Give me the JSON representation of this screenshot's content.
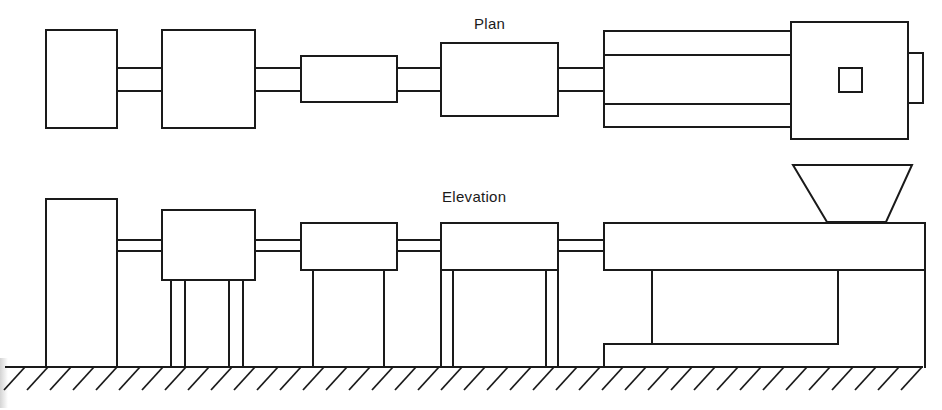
{
  "diagram": {
    "type": "engineering-drawing",
    "colors": {
      "line": "#1a1a1a",
      "background": "#ffffff"
    }
  },
  "views": {
    "plan": {
      "label": "Plan",
      "components": [
        {
          "name": "unit-1",
          "x": 46,
          "y": 30,
          "w": 71,
          "h": 98
        },
        {
          "name": "unit-2",
          "x": 162,
          "y": 30,
          "w": 93,
          "h": 98
        },
        {
          "name": "unit-3",
          "x": 301,
          "y": 56,
          "w": 96,
          "h": 46
        },
        {
          "name": "unit-4",
          "x": 441,
          "y": 43,
          "w": 117,
          "h": 73
        },
        {
          "name": "extruder-barrel",
          "x": 604,
          "y": 31,
          "w": 187,
          "h": 96
        },
        {
          "name": "extruder-drive-housing",
          "x": 791,
          "y": 22,
          "w": 117,
          "h": 117
        },
        {
          "name": "hopper-opening",
          "x": 839,
          "y": 68,
          "w": 23,
          "h": 24
        },
        {
          "name": "end-tab",
          "x": 908,
          "y": 53,
          "w": 15,
          "h": 50
        }
      ]
    },
    "elevation": {
      "label": "Elevation",
      "components": [
        {
          "name": "unit-1",
          "x": 46,
          "y": 199,
          "w": 71,
          "h": 168
        },
        {
          "name": "unit-2",
          "x": 162,
          "y": 210,
          "w": 93,
          "h": 70
        },
        {
          "name": "unit-3",
          "x": 301,
          "y": 223,
          "w": 96,
          "h": 47
        },
        {
          "name": "unit-4",
          "x": 441,
          "y": 223,
          "w": 117,
          "h": 47
        },
        {
          "name": "extruder-barrel",
          "x": 604,
          "y": 223,
          "w": 321,
          "h": 47
        },
        {
          "name": "hopper",
          "top": [
            793,
            912
          ],
          "bottom": [
            827,
            886
          ],
          "y_top": 165,
          "y_bottom": 222
        },
        {
          "name": "base-frame",
          "x": 604,
          "y": 270,
          "w": 321,
          "h": 97
        }
      ]
    }
  },
  "ground": {
    "y": 367,
    "x_start": 6,
    "x_end": 922,
    "hatch_spacing": 23
  }
}
